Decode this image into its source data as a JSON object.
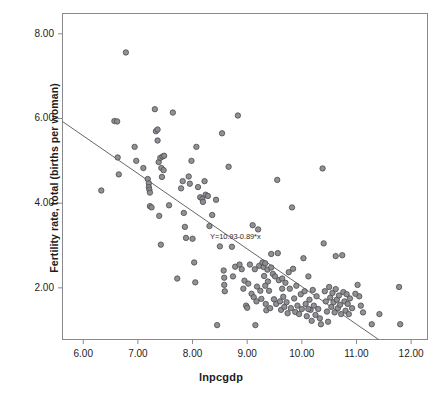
{
  "chart_data": {
    "type": "scatter",
    "title": "",
    "xlabel": "lnpcgdp",
    "ylabel": "Fertility rate, total (births per woman)",
    "xlim": [
      5.62,
      12.3
    ],
    "ylim": [
      0.78,
      8.48
    ],
    "xticks": [
      "6.00",
      "7.00",
      "8.00",
      "9.00",
      "10.00",
      "11.00",
      "12.00"
    ],
    "xtick_values": [
      6,
      7,
      8,
      9,
      10,
      11,
      12
    ],
    "yticks": [
      "2.00",
      "4.00",
      "6.00",
      "8.00"
    ],
    "ytick_values": [
      2,
      4,
      6,
      8
    ],
    "grid": false,
    "legend": "none",
    "marker": {
      "shape": "circle",
      "fill": "#8b8b8f",
      "edge": "#4a4a4e",
      "size_px": 5.4,
      "opacity": 0.95
    },
    "fit_line": {
      "label": "Y=10.93-0.89*x",
      "intercept": 10.93,
      "slope": -0.89,
      "color": "#555558",
      "width_px": 0.9,
      "annotation_x": 8.32,
      "annotation_y": 3.2
    },
    "n_points": 181,
    "points": [
      [
        6.33,
        4.3
      ],
      [
        6.57,
        5.94
      ],
      [
        6.62,
        5.93
      ],
      [
        6.63,
        5.08
      ],
      [
        6.65,
        4.68
      ],
      [
        6.78,
        7.56
      ],
      [
        6.94,
        5.33
      ],
      [
        6.97,
        5.0
      ],
      [
        7.1,
        4.83
      ],
      [
        7.18,
        4.57
      ],
      [
        7.2,
        4.47
      ],
      [
        7.2,
        4.38
      ],
      [
        7.21,
        4.32
      ],
      [
        7.22,
        4.25
      ],
      [
        7.22,
        3.93
      ],
      [
        7.25,
        3.9
      ],
      [
        7.31,
        6.22
      ],
      [
        7.33,
        5.7
      ],
      [
        7.36,
        5.74
      ],
      [
        7.36,
        5.48
      ],
      [
        7.38,
        4.97
      ],
      [
        7.41,
        5.07
      ],
      [
        7.45,
        5.1
      ],
      [
        7.48,
        5.12
      ],
      [
        7.43,
        4.83
      ],
      [
        7.47,
        4.78
      ],
      [
        7.44,
        4.62
      ],
      [
        7.39,
        3.7
      ],
      [
        7.42,
        3.02
      ],
      [
        7.57,
        3.95
      ],
      [
        7.64,
        6.14
      ],
      [
        7.72,
        2.22
      ],
      [
        7.79,
        4.35
      ],
      [
        7.82,
        4.52
      ],
      [
        7.84,
        3.77
      ],
      [
        7.86,
        3.44
      ],
      [
        7.88,
        3.18
      ],
      [
        7.93,
        4.63
      ],
      [
        7.95,
        4.46
      ],
      [
        7.98,
        5.0
      ],
      [
        8.0,
        3.16
      ],
      [
        8.03,
        2.6
      ],
      [
        8.05,
        2.13
      ],
      [
        8.07,
        5.33
      ],
      [
        8.1,
        4.38
      ],
      [
        8.14,
        4.14
      ],
      [
        8.18,
        4.1
      ],
      [
        8.19,
        4.03
      ],
      [
        8.22,
        4.52
      ],
      [
        8.24,
        4.2
      ],
      [
        8.28,
        4.17
      ],
      [
        8.31,
        3.46
      ],
      [
        8.36,
        3.72
      ],
      [
        8.43,
        4.08
      ],
      [
        8.45,
        1.12
      ],
      [
        8.5,
        2.98
      ],
      [
        8.54,
        5.65
      ],
      [
        8.57,
        2.41
      ],
      [
        8.58,
        2.24
      ],
      [
        8.58,
        2.07
      ],
      [
        8.59,
        1.92
      ],
      [
        8.66,
        4.86
      ],
      [
        8.72,
        2.97
      ],
      [
        8.74,
        2.27
      ],
      [
        8.78,
        2.5
      ],
      [
        8.83,
        6.07
      ],
      [
        8.86,
        2.55
      ],
      [
        8.9,
        2.44
      ],
      [
        8.93,
        1.98
      ],
      [
        8.95,
        2.17
      ],
      [
        8.98,
        1.58
      ],
      [
        9.0,
        1.53
      ],
      [
        9.02,
        2.1
      ],
      [
        9.05,
        2.55
      ],
      [
        9.08,
        1.86
      ],
      [
        9.1,
        3.48
      ],
      [
        9.12,
        1.78
      ],
      [
        9.14,
        2.44
      ],
      [
        9.15,
        1.12
      ],
      [
        9.17,
        1.68
      ],
      [
        9.18,
        2.03
      ],
      [
        9.2,
        3.38
      ],
      [
        9.22,
        2.52
      ],
      [
        9.24,
        1.93
      ],
      [
        9.26,
        1.74
      ],
      [
        9.28,
        2.6
      ],
      [
        9.3,
        2.49
      ],
      [
        9.31,
        2.28
      ],
      [
        9.33,
        2.05
      ],
      [
        9.34,
        1.62
      ],
      [
        9.35,
        1.47
      ],
      [
        9.37,
        2.43
      ],
      [
        9.38,
        2.15
      ],
      [
        9.4,
        1.93
      ],
      [
        9.42,
        1.52
      ],
      [
        9.44,
        2.8
      ],
      [
        9.47,
        2.33
      ],
      [
        9.49,
        1.73
      ],
      [
        9.51,
        2.27
      ],
      [
        9.53,
        1.62
      ],
      [
        9.55,
        4.55
      ],
      [
        9.56,
        2.82
      ],
      [
        9.58,
        2.18
      ],
      [
        9.6,
        1.68
      ],
      [
        9.62,
        1.48
      ],
      [
        9.64,
        2.22
      ],
      [
        9.66,
        1.79
      ],
      [
        9.68,
        1.55
      ],
      [
        9.7,
        2.12
      ],
      [
        9.72,
        1.66
      ],
      [
        9.74,
        1.4
      ],
      [
        9.76,
        2.37
      ],
      [
        9.78,
        1.98
      ],
      [
        9.8,
        1.52
      ],
      [
        9.82,
        3.9
      ],
      [
        9.84,
        2.45
      ],
      [
        9.86,
        1.75
      ],
      [
        9.88,
        1.43
      ],
      [
        9.9,
        2.05
      ],
      [
        9.92,
        1.58
      ],
      [
        9.95,
        1.38
      ],
      [
        9.98,
        1.85
      ],
      [
        10.0,
        1.5
      ],
      [
        10.03,
        2.7
      ],
      [
        10.05,
        1.92
      ],
      [
        10.07,
        1.62
      ],
      [
        10.09,
        1.33
      ],
      [
        10.12,
        2.27
      ],
      [
        10.14,
        1.72
      ],
      [
        10.16,
        1.48
      ],
      [
        10.18,
        1.22
      ],
      [
        10.2,
        1.95
      ],
      [
        10.22,
        1.58
      ],
      [
        10.25,
        1.36
      ],
      [
        10.27,
        1.8
      ],
      [
        10.3,
        1.5
      ],
      [
        10.33,
        1.28
      ],
      [
        10.35,
        1.14
      ],
      [
        10.38,
        4.82
      ],
      [
        10.4,
        3.05
      ],
      [
        10.42,
        1.92
      ],
      [
        10.44,
        1.68
      ],
      [
        10.46,
        1.44
      ],
      [
        10.48,
        1.2
      ],
      [
        10.5,
        2.02
      ],
      [
        10.52,
        1.77
      ],
      [
        10.54,
        1.55
      ],
      [
        10.56,
        1.88
      ],
      [
        10.58,
        1.66
      ],
      [
        10.6,
        1.42
      ],
      [
        10.62,
        1.97
      ],
      [
        10.64,
        1.72
      ],
      [
        10.66,
        1.52
      ],
      [
        10.68,
        1.82
      ],
      [
        10.7,
        1.6
      ],
      [
        10.72,
        1.38
      ],
      [
        10.74,
        2.77
      ],
      [
        10.76,
        1.9
      ],
      [
        10.78,
        1.68
      ],
      [
        10.8,
        1.46
      ],
      [
        10.82,
        1.85
      ],
      [
        10.84,
        1.62
      ],
      [
        10.86,
        1.38
      ],
      [
        10.88,
        1.75
      ],
      [
        10.62,
        2.75
      ],
      [
        10.92,
        1.52
      ],
      [
        11.02,
        2.07
      ],
      [
        11.05,
        1.8
      ],
      [
        11.08,
        1.58
      ],
      [
        11.12,
        1.42
      ],
      [
        11.28,
        1.14
      ],
      [
        11.42,
        1.38
      ],
      [
        11.78,
        2.02
      ],
      [
        11.8,
        1.14
      ],
      [
        10.98,
        1.86
      ],
      [
        9.33,
        2.58
      ],
      [
        9.44,
        2.48
      ],
      [
        9.64,
        1.98
      ],
      [
        10.12,
        1.5
      ]
    ]
  },
  "axis": {
    "frame_color": "#8a8a8e",
    "tick_color": "#8a8a8e"
  }
}
